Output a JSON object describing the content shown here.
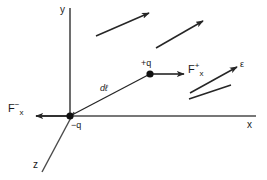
{
  "figure": {
    "background_color": "#ffffff",
    "stroke_color": "#262626",
    "text_color": "#1a1a1a",
    "width": 267,
    "height": 180
  },
  "axes": {
    "y_label": "y",
    "x_label": "x",
    "z_label": "z",
    "origin": {
      "x": 70,
      "y": 116
    }
  },
  "charges": {
    "negative": {
      "label": "−q",
      "x": 70,
      "y": 116
    },
    "positive": {
      "label": "+q",
      "x": 150,
      "y": 74
    }
  },
  "displacement": {
    "label": "dℓ",
    "from_x": 70,
    "from_y": 116,
    "to_x": 150,
    "to_y": 74
  },
  "forces": {
    "positive_force": {
      "base": "F",
      "superscript": "+",
      "subscript": "x",
      "arrow_from_x": 152,
      "arrow_from_y": 74,
      "arrow_to_x": 183,
      "arrow_to_y": 74
    },
    "negative_force": {
      "base": "F",
      "superscript": "−",
      "subscript": "x",
      "arrow_from_x": 68,
      "arrow_from_y": 116,
      "arrow_to_x": 34,
      "arrow_to_y": 116
    }
  },
  "field": {
    "label": "ε",
    "arrows": [
      {
        "x1": 96,
        "y1": 36,
        "x2": 149,
        "y2": 13
      },
      {
        "x1": 156,
        "y1": 48,
        "x2": 203,
        "y2": 21
      },
      {
        "x1": 190,
        "y1": 93,
        "x2": 237,
        "y2": 67
      },
      {
        "x1": 189,
        "y1": 98,
        "x2": 232,
        "y2": 84,
        "headless": true
      }
    ]
  }
}
